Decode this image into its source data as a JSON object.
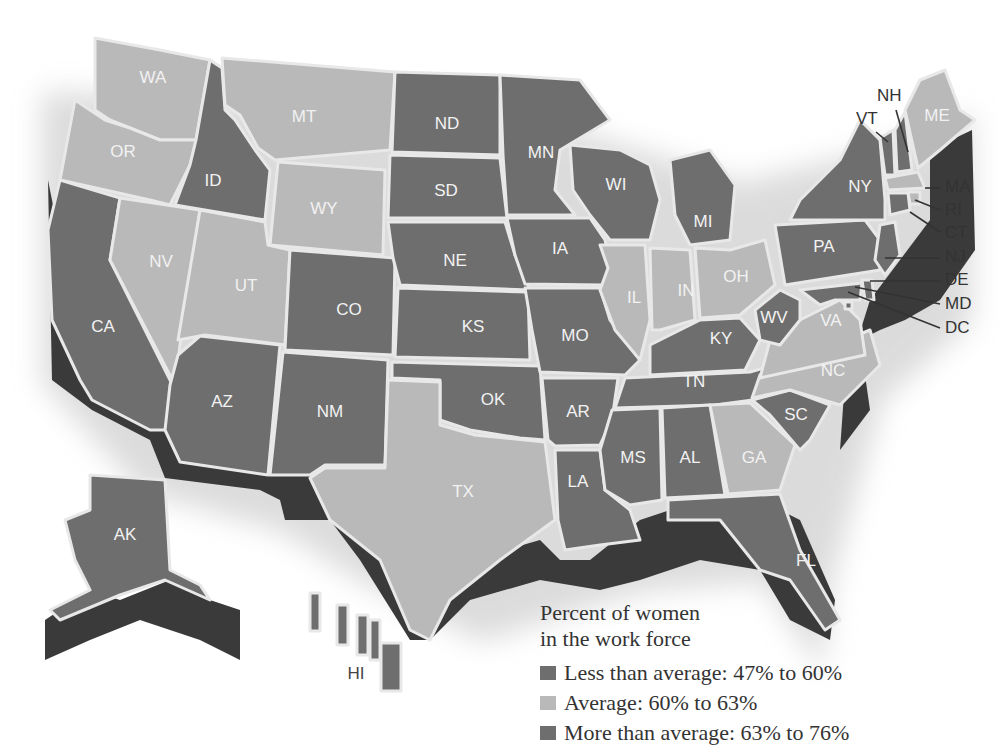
{
  "legend": {
    "title_line1": "Percent of women",
    "title_line2": "in the work force",
    "items": [
      {
        "label": "Less than average: 47% to 60%",
        "color": "#6e6e6e"
      },
      {
        "label": "Average: 60% to 63%",
        "color": "#b9b9b9"
      },
      {
        "label": "More than average: 63% to 76%",
        "color": "#6e6e6e"
      }
    ]
  },
  "map": {
    "title": "Percent of women in the work force",
    "note": "Grayscale rendering: the two dark categories are not visually distinguishable",
    "states": {
      "WA": {
        "label": "WA",
        "shade": "light"
      },
      "OR": {
        "label": "OR",
        "shade": "light"
      },
      "CA": {
        "label": "CA",
        "shade": "dark"
      },
      "ID": {
        "label": "ID",
        "shade": "dark"
      },
      "MT": {
        "label": "MT",
        "shade": "light"
      },
      "WY": {
        "label": "WY",
        "shade": "light"
      },
      "NV": {
        "label": "NV",
        "shade": "light"
      },
      "UT": {
        "label": "UT",
        "shade": "light"
      },
      "AZ": {
        "label": "AZ",
        "shade": "dark"
      },
      "CO": {
        "label": "CO",
        "shade": "dark"
      },
      "NM": {
        "label": "NM",
        "shade": "dark"
      },
      "ND": {
        "label": "ND",
        "shade": "dark"
      },
      "SD": {
        "label": "SD",
        "shade": "dark"
      },
      "NE": {
        "label": "NE",
        "shade": "dark"
      },
      "KS": {
        "label": "KS",
        "shade": "dark"
      },
      "OK": {
        "label": "OK",
        "shade": "dark"
      },
      "TX": {
        "label": "TX",
        "shade": "light"
      },
      "MN": {
        "label": "MN",
        "shade": "dark"
      },
      "IA": {
        "label": "IA",
        "shade": "dark"
      },
      "MO": {
        "label": "MO",
        "shade": "dark"
      },
      "AR": {
        "label": "AR",
        "shade": "dark"
      },
      "LA": {
        "label": "LA",
        "shade": "dark"
      },
      "WI": {
        "label": "WI",
        "shade": "dark"
      },
      "IL": {
        "label": "IL",
        "shade": "light"
      },
      "MI": {
        "label": "MI",
        "shade": "dark"
      },
      "IN": {
        "label": "IN",
        "shade": "light"
      },
      "OH": {
        "label": "OH",
        "shade": "light"
      },
      "KY": {
        "label": "KY",
        "shade": "dark"
      },
      "TN": {
        "label": "TN",
        "shade": "dark"
      },
      "MS": {
        "label": "MS",
        "shade": "dark"
      },
      "AL": {
        "label": "AL",
        "shade": "dark"
      },
      "GA": {
        "label": "GA",
        "shade": "light"
      },
      "FL": {
        "label": "FL",
        "shade": "dark"
      },
      "SC": {
        "label": "SC",
        "shade": "dark"
      },
      "NC": {
        "label": "NC",
        "shade": "light"
      },
      "VA": {
        "label": "VA",
        "shade": "light"
      },
      "WV": {
        "label": "WV",
        "shade": "dark"
      },
      "PA": {
        "label": "PA",
        "shade": "dark"
      },
      "NY": {
        "label": "NY",
        "shade": "dark"
      },
      "VT": {
        "label": "VT",
        "shade": "dark"
      },
      "NH": {
        "label": "NH",
        "shade": "dark"
      },
      "ME": {
        "label": "ME",
        "shade": "light"
      },
      "MA": {
        "label": "MA",
        "shade": "light"
      },
      "RI": {
        "label": "RI",
        "shade": "light"
      },
      "CT": {
        "label": "CT",
        "shade": "dark"
      },
      "NJ": {
        "label": "NJ",
        "shade": "dark"
      },
      "DE": {
        "label": "DE",
        "shade": "dark"
      },
      "MD": {
        "label": "MD",
        "shade": "dark"
      },
      "DC": {
        "label": "DC",
        "shade": "dark"
      },
      "AK": {
        "label": "AK",
        "shade": "dark"
      },
      "HI": {
        "label": "HI",
        "shade": "dark"
      }
    }
  }
}
